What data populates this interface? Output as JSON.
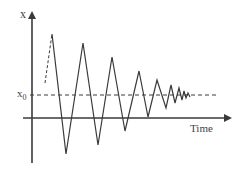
{
  "diagram": {
    "y_axis_label": "x",
    "reference_label_base": "x",
    "reference_label_sub": "0",
    "x_axis_label": "Time",
    "colors": {
      "line": "#3a3a3a",
      "text": "#444444"
    }
  }
}
